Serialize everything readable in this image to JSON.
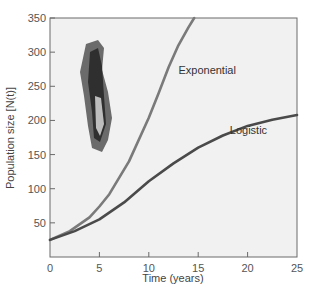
{
  "chart_data": {
    "type": "line",
    "title": "",
    "xlabel": "Time (years)",
    "ylabel": "Population size [N(t)]",
    "xlim": [
      0,
      25
    ],
    "ylim": [
      0,
      350
    ],
    "xticks": [
      0,
      5,
      10,
      15,
      20,
      25
    ],
    "yticks": [
      50,
      100,
      150,
      200,
      250,
      300,
      350
    ],
    "grid": false,
    "legend": "inline labels",
    "series": [
      {
        "name": "Exponential",
        "color": "#7a7a7a",
        "x": [
          0,
          2,
          4,
          5,
          6,
          8,
          10,
          11,
          12,
          13,
          14,
          14.6
        ],
        "y": [
          25,
          38,
          58,
          74,
          92,
          140,
          204,
          240,
          278,
          310,
          336,
          350
        ]
      },
      {
        "name": "Logistic",
        "color": "#4a4a4a",
        "x": [
          0,
          2.5,
          5,
          7.5,
          10,
          12.5,
          15,
          17.5,
          20,
          22.5,
          25
        ],
        "y": [
          25,
          38,
          55,
          80,
          111,
          137,
          160,
          178,
          192,
          201,
          208
        ]
      }
    ],
    "annotations": [
      {
        "text": "Exponential",
        "x": 13,
        "y": 268
      },
      {
        "text": "Logistic",
        "x": 18.2,
        "y": 180
      }
    ]
  },
  "colors": {
    "plot_background": "#f1f1f1",
    "axis": "#6a6a6a",
    "exponential": "#7a7a7a",
    "logistic": "#4a4a4a"
  }
}
